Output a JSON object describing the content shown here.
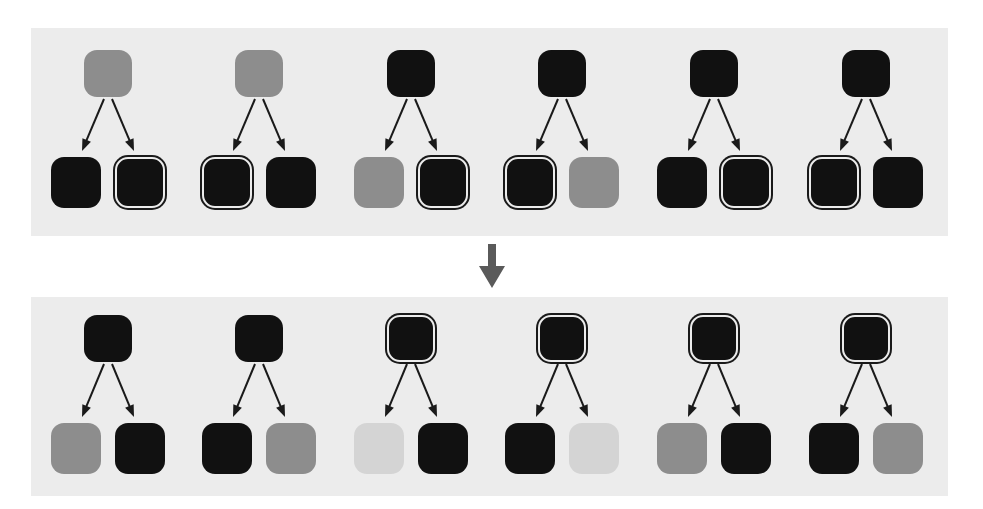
{
  "figure": {
    "title": "",
    "type": "two-panel node-pair diagram",
    "background_color": "#ffffff",
    "panel_color": "#ececec",
    "colors": {
      "black": "#111111",
      "gray": "#8d8d8d",
      "light_gray": "#d4d4d4",
      "outline": "#1a1a1a",
      "arrow": "#1a1a1a",
      "transition_arrow": "#5a5a5a"
    },
    "transition_arrow": {
      "icon": "down-arrow-icon",
      "direction": "down",
      "color": "#5a5a5a"
    },
    "panels": [
      {
        "id": "panel-top",
        "name": "before-panel",
        "label": "",
        "groups": [
          {
            "id": "top-g1",
            "parent": {
              "fill": "gray",
              "outlined": false
            },
            "children": [
              {
                "fill": "black",
                "outlined": false
              },
              {
                "fill": "black",
                "outlined": true
              }
            ]
          },
          {
            "id": "top-g2",
            "parent": {
              "fill": "gray",
              "outlined": false
            },
            "children": [
              {
                "fill": "black",
                "outlined": true
              },
              {
                "fill": "black",
                "outlined": false
              }
            ]
          },
          {
            "id": "top-g3",
            "parent": {
              "fill": "black",
              "outlined": false
            },
            "children": [
              {
                "fill": "gray",
                "outlined": false
              },
              {
                "fill": "black",
                "outlined": true
              }
            ]
          },
          {
            "id": "top-g4",
            "parent": {
              "fill": "black",
              "outlined": false
            },
            "children": [
              {
                "fill": "black",
                "outlined": true
              },
              {
                "fill": "gray",
                "outlined": false
              }
            ]
          },
          {
            "id": "top-g5",
            "parent": {
              "fill": "black",
              "outlined": false
            },
            "children": [
              {
                "fill": "black",
                "outlined": false
              },
              {
                "fill": "black",
                "outlined": true
              }
            ]
          },
          {
            "id": "top-g6",
            "parent": {
              "fill": "black",
              "outlined": false
            },
            "children": [
              {
                "fill": "black",
                "outlined": true
              },
              {
                "fill": "black",
                "outlined": false
              }
            ]
          }
        ]
      },
      {
        "id": "panel-bottom",
        "name": "after-panel",
        "label": "",
        "groups": [
          {
            "id": "bot-g1",
            "parent": {
              "fill": "black",
              "outlined": false
            },
            "children": [
              {
                "fill": "gray",
                "outlined": false
              },
              {
                "fill": "black",
                "outlined": false
              }
            ]
          },
          {
            "id": "bot-g2",
            "parent": {
              "fill": "black",
              "outlined": false
            },
            "children": [
              {
                "fill": "black",
                "outlined": false
              },
              {
                "fill": "gray",
                "outlined": false
              }
            ]
          },
          {
            "id": "bot-g3",
            "parent": {
              "fill": "black",
              "outlined": true
            },
            "children": [
              {
                "fill": "light_gray",
                "outlined": false
              },
              {
                "fill": "black",
                "outlined": false
              }
            ]
          },
          {
            "id": "bot-g4",
            "parent": {
              "fill": "black",
              "outlined": true
            },
            "children": [
              {
                "fill": "black",
                "outlined": false
              },
              {
                "fill": "light_gray",
                "outlined": false
              }
            ]
          },
          {
            "id": "bot-g5",
            "parent": {
              "fill": "black",
              "outlined": true
            },
            "children": [
              {
                "fill": "gray",
                "outlined": false
              },
              {
                "fill": "black",
                "outlined": false
              }
            ]
          },
          {
            "id": "bot-g6",
            "parent": {
              "fill": "black",
              "outlined": true
            },
            "children": [
              {
                "fill": "black",
                "outlined": false
              },
              {
                "fill": "gray",
                "outlined": false
              }
            ]
          }
        ]
      }
    ],
    "geometry": {
      "group_centers_x": [
        108,
        259,
        411,
        562,
        714,
        866
      ],
      "top_parent_y": 50,
      "top_child_y": 157,
      "bottom_parent_y": 315,
      "bottom_child_y": 423,
      "child_offset_x": 32,
      "parent_w": 48,
      "parent_h": 47,
      "child_w": 50,
      "child_h": 51
    }
  }
}
